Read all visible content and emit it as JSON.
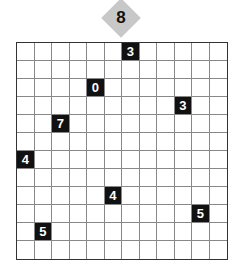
{
  "puzzle": {
    "badge_value": "8",
    "rows": 12,
    "cols": 12,
    "clues": [
      {
        "row": 0,
        "col": 6,
        "value": "3"
      },
      {
        "row": 2,
        "col": 4,
        "value": "0"
      },
      {
        "row": 3,
        "col": 9,
        "value": "3"
      },
      {
        "row": 4,
        "col": 2,
        "value": "7"
      },
      {
        "row": 6,
        "col": 0,
        "value": "4"
      },
      {
        "row": 8,
        "col": 5,
        "value": "4"
      },
      {
        "row": 9,
        "col": 10,
        "value": "5"
      },
      {
        "row": 10,
        "col": 1,
        "value": "5"
      }
    ],
    "colors": {
      "clue_bg": "#111111",
      "clue_text": "#ffffff",
      "badge_bg": "#c8c8c8",
      "grid_line": "#888888"
    }
  }
}
